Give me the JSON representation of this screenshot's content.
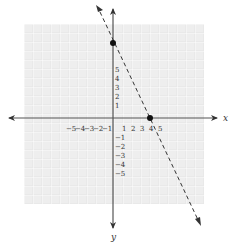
{
  "graph": {
    "x_axis_label": "x",
    "y_axis_label": "y",
    "x_ticks": [
      "−5",
      "−4",
      "−3",
      "−2",
      "−1",
      "1",
      "2",
      "3",
      "4",
      "5"
    ],
    "y_ticks_positive": [
      "5",
      "4",
      "3",
      "2",
      "1"
    ],
    "y_ticks_negative": [
      "−1",
      "−2",
      "−3",
      "−4",
      "−5"
    ],
    "line_style": "dashed",
    "points": [
      {
        "label": "y-intercept",
        "x": 0,
        "y": 8
      },
      {
        "label": "x-intercept",
        "x": 4,
        "y": 0
      }
    ],
    "colors": {
      "grid": "#e6e6e6",
      "axis": "#555555",
      "line": "#333333"
    }
  }
}
